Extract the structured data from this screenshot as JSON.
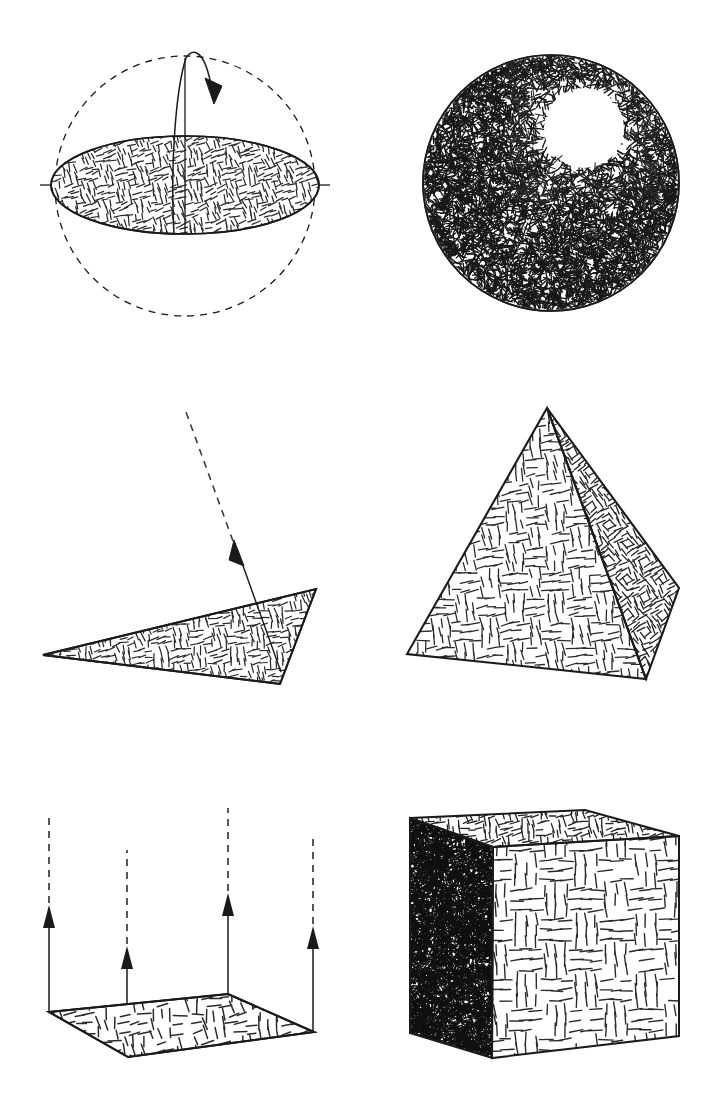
{
  "figure": {
    "background_color": "#ffffff",
    "ink_color": "#1a1a1a",
    "width": 722,
    "height": 1113,
    "columns": 2,
    "rows": 3
  },
  "panels": [
    {
      "id": "wireframe-sphere",
      "name": "wireframe-sphere-with-hatched-equatorial-disc",
      "position": {
        "row": 1,
        "column": 1,
        "x": 0,
        "y": 0,
        "width": 361,
        "height": 371
      },
      "description": "Dashed outline sphere with a solid hatched equatorial ellipse, an axis tick at each equator end, a vertical radius line and a curved rotation arrow over the north pole.",
      "sphere": {
        "cx": 185,
        "cy": 186,
        "r": 130,
        "stroke": "#1a1a1a",
        "stroke_width": 1.2,
        "dash": "7 6",
        "fill": "none"
      },
      "disc": {
        "cx": 185,
        "cy": 185,
        "rx": 134,
        "ry": 49,
        "stroke": "#1a1a1a",
        "stroke_width": 1.6,
        "hatch": "equator-disc-hatch",
        "hatch_density": "medium"
      },
      "equator_ticks": [
        {
          "name": "left-equator-tick",
          "x1": 40,
          "y1": 185,
          "x2": 62,
          "y2": 185
        },
        {
          "name": "right-equator-tick",
          "x1": 308,
          "y1": 185,
          "x2": 330,
          "y2": 185
        }
      ],
      "axis_line": {
        "x1": 185,
        "y1": 58,
        "x2": 185,
        "y2": 234
      },
      "rotation_arrow": {
        "path": "M 172 232 C 170 160 176 86 186 58 C 193 48 200 54 205 66 C 209 76 212 88 214 98",
        "arrowhead_at": {
          "x": 214,
          "y": 99
        },
        "arrowhead_angle": 75
      }
    },
    {
      "id": "shaded-sphere",
      "name": "fully-hatched-sphere-with-specular-highlight",
      "position": {
        "row": 1,
        "column": 2,
        "x": 361,
        "y": 0,
        "width": 361,
        "height": 371
      },
      "description": "Solid circle densely filled with short random strokes, darkest at lower left, with an unhatched circular specular highlight in the upper right.",
      "circle": {
        "cx": 551,
        "cy": 183,
        "r": 128,
        "stroke": "#1a1a1a",
        "stroke_width": 1.6,
        "fill": "none"
      },
      "highlight": {
        "cx": 584,
        "cy": 128,
        "r": 41,
        "fill": "#ffffff"
      },
      "hatch_density": "very-high",
      "shading_gradient": "dark at lower-left, light toward upper-right highlight"
    },
    {
      "id": "normal-triangle",
      "name": "hatched-triangle-with-surface-normal",
      "position": {
        "row": 2,
        "column": 1,
        "x": 0,
        "y": 371,
        "width": 361,
        "height": 371
      },
      "description": "A thin hatched triangle lying nearly flat, with a single surface-normal arrow rising from it: solid with arrowhead near the surface and dashed above.",
      "triangle": {
        "points": "43,655 316,589 280,684",
        "stroke": "#1a1a1a",
        "stroke_width": 1.8,
        "hatch": "plate-hatch",
        "hatch_density": "medium"
      },
      "normal": {
        "solid_segment": {
          "x1": 280,
          "y1": 670,
          "x2": 236,
          "y2": 548
        },
        "dashed_segment": {
          "x1": 233,
          "y1": 540,
          "x2": 185,
          "y2": 412,
          "dash": "7 6"
        },
        "arrowhead_at": {
          "x": 236,
          "y": 548
        },
        "arrowhead_angle": -110
      }
    },
    {
      "id": "pyramid",
      "name": "hatched-square-pyramid",
      "position": {
        "row": 2,
        "column": 2,
        "x": 361,
        "y": 371,
        "width": 361,
        "height": 371
      },
      "description": "A square pyramid in three-quarter view showing two faces: a large lighter-hatched front-left face and a narrower, denser-hatched right face.",
      "apex": {
        "x": 547,
        "y": 408
      },
      "faces": [
        {
          "name": "pyramid-front-face",
          "points": "547,408 407,654 646,679",
          "hatch": "pyramid-front-hatch",
          "hatch_density": "medium"
        },
        {
          "name": "pyramid-right-face",
          "points": "547,408 646,679 679,588",
          "hatch": "pyramid-side-hatch",
          "hatch_density": "high"
        }
      ],
      "stroke": "#1a1a1a",
      "stroke_width": 2.0
    },
    {
      "id": "normal-plane",
      "name": "hatched-ground-plane-with-four-normals",
      "position": {
        "row": 3,
        "column": 1,
        "x": 0,
        "y": 742,
        "width": 361,
        "height": 371
      },
      "description": "A hatched quadrilateral plane seen in perspective with four vertical surface-normal arrows, one at each corner; each arrow is solid near the plane and dashed further up.",
      "plane": {
        "points": "49,1012 228,994 314,1032 128,1057",
        "stroke": "#1a1a1a",
        "stroke_width": 2.0,
        "hatch": "floor-hatch",
        "hatch_density": "low"
      },
      "normals": [
        {
          "name": "normal-arrow-left",
          "base_x": 49,
          "base_y": 1012,
          "arrow_tip_y": 918,
          "dash_top_y": 818
        },
        {
          "name": "normal-arrow-front",
          "base_x": 127,
          "base_y": 1057,
          "arrow_tip_y": 958,
          "dash_top_y": 850
        },
        {
          "name": "normal-arrow-back",
          "base_x": 228,
          "base_y": 994,
          "arrow_tip_y": 905,
          "dash_top_y": 808
        },
        {
          "name": "normal-arrow-right",
          "base_x": 313,
          "base_y": 1032,
          "arrow_tip_y": 938,
          "dash_top_y": 834
        }
      ],
      "arrow_dash": "7 6"
    },
    {
      "id": "cube",
      "name": "hatched-cube-three-faces",
      "position": {
        "row": 3,
        "column": 2,
        "x": 361,
        "y": 742,
        "width": 361,
        "height": 371
      },
      "description": "A cube in three-quarter view: a medium-hatched top face, a very dense dark left face, and a light sparsely hatched front-right face.",
      "faces": [
        {
          "name": "cube-top-face",
          "points": "410,818 585,810 679,836 493,847",
          "hatch": "cube-top-hatch",
          "hatch_density": "medium"
        },
        {
          "name": "cube-left-face",
          "points": "410,818 493,847 492,1058 410,1033",
          "hatch": "cube-left-hatch",
          "hatch_density": "very-high"
        },
        {
          "name": "cube-front-face",
          "points": "493,847 679,836 679,1036 492,1058",
          "hatch": "cube-front-hatch",
          "hatch_density": "low"
        }
      ],
      "stroke": "#1a1a1a",
      "stroke_width": 2.0
    }
  ]
}
